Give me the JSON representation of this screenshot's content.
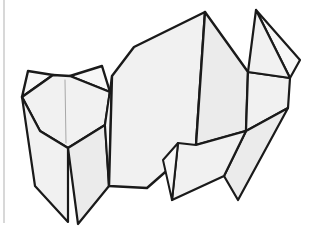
{
  "image": {
    "title": "Origami figure line drawing",
    "subject": "origami-cat",
    "width": 327,
    "height": 241,
    "background_color": "#ffffff"
  },
  "palette": {
    "paper_fill": "#f1f1f1",
    "paper_fill_light": "#f7f7f7",
    "paper_fill_shade": "#ebebeb",
    "outline": "#1a1a1a",
    "soft_crease": "#a8a8a8",
    "page_edge": "#d8d8d8"
  },
  "strokes": {
    "outline_width": 2.4,
    "inner_width": 2.0,
    "crease_width": 1.0
  },
  "decorations": [
    {
      "name": "page-edge-rule",
      "kind": "vertical-line",
      "color": "#d8d8d8",
      "x": 3,
      "y": 0,
      "height": 223,
      "width": 2
    }
  ],
  "figure": {
    "name": "origami-cat",
    "parts": [
      {
        "id": "left-ear",
        "label": "Left ear",
        "fill": "#f7f7f7",
        "stroke_width": 2.4,
        "points": "28,71 53,75 22,97"
      },
      {
        "id": "right-ear",
        "label": "Right ear",
        "fill": "#f7f7f7",
        "stroke_width": 2.4,
        "points": "70,76 102,66 110,92"
      },
      {
        "id": "head",
        "label": "Head / face panel",
        "fill": "#f1f1f1",
        "stroke_width": 2.4,
        "points": "22,97 53,75 70,76 110,92 105,125 68,148 40,131"
      },
      {
        "id": "left-foreleg",
        "label": "Left foreleg",
        "fill": "#f1f1f1",
        "stroke_width": 2.2,
        "points": "22,97 40,131 68,148 68,222 35,186"
      },
      {
        "id": "right-foreleg",
        "label": "Right foreleg",
        "fill": "#ebebeb",
        "stroke_width": 2.2,
        "points": "68,148 105,125 109,186 78,224"
      },
      {
        "id": "chest-wedge",
        "label": "Chest wedge under head",
        "fill": "#f7f7f7",
        "stroke_width": 2.0,
        "points": "105,125 112,76 109,186"
      },
      {
        "id": "back-left-panel",
        "label": "Back left body panel",
        "fill": "#f1f1f1",
        "stroke_width": 2.4,
        "points": "112,76 134,47 205,12 196,145 147,188 109,186"
      },
      {
        "id": "back-right-panel",
        "label": "Back right body panel",
        "fill": "#ebebeb",
        "stroke_width": 2.4,
        "points": "205,12 248,72 246,131 196,145"
      },
      {
        "id": "haunch",
        "label": "Rear haunch",
        "fill": "#f1f1f1",
        "stroke_width": 2.2,
        "points": "248,72 290,78 288,108 246,131"
      },
      {
        "id": "tail-outer",
        "label": "Tail outer facet",
        "fill": "#f7f7f7",
        "stroke_width": 2.2,
        "points": "256,10 290,78 300,60"
      },
      {
        "id": "tail-inner",
        "label": "Tail inner facet",
        "fill": "#f1f1f1",
        "stroke_width": 2.2,
        "points": "256,10 248,72 290,78"
      },
      {
        "id": "hind-leg-rear",
        "label": "Rear hind leg",
        "fill": "#ebebeb",
        "stroke_width": 2.2,
        "points": "246,131 288,108 238,200 224,176"
      },
      {
        "id": "hind-leg-front",
        "label": "Front hind leg",
        "fill": "#f1f1f1",
        "stroke_width": 2.2,
        "points": "178,143 196,145 246,131 224,176 172,200"
      },
      {
        "id": "hind-leg-sliver",
        "label": "Hind leg inner sliver",
        "fill": "#f7f7f7",
        "stroke_width": 2.0,
        "points": "178,143 172,200 163,160"
      }
    ],
    "creases": [
      {
        "id": "face-center-crease",
        "label": "Face centre crease",
        "d": "M 65,80 L 66,143"
      }
    ]
  }
}
